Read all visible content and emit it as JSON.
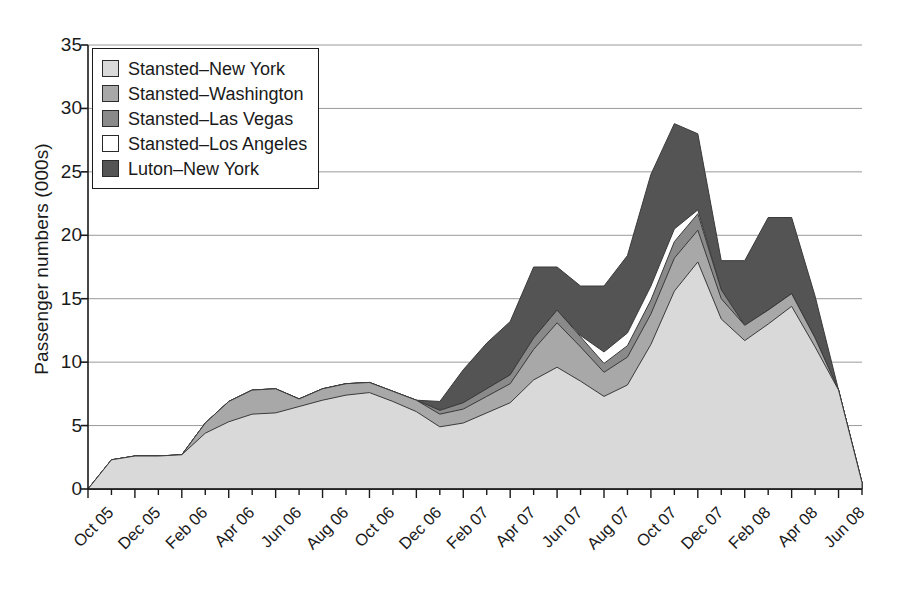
{
  "chart_data": {
    "type": "area",
    "stacked": true,
    "title": "",
    "xlabel": "",
    "ylabel": "Passenger numbers (000s)",
    "ylim": [
      0,
      35
    ],
    "yticks": [
      0,
      5,
      10,
      15,
      20,
      25,
      30,
      35
    ],
    "grid": "horizontal",
    "legend_position": "top-left",
    "x": [
      "Oct 05",
      "Nov 05",
      "Dec 05",
      "Jan 06",
      "Feb 06",
      "Mar 06",
      "Apr 06",
      "May 06",
      "Jun 06",
      "Jul 06",
      "Aug 06",
      "Sep 06",
      "Oct 06",
      "Nov 06",
      "Dec 06",
      "Jan 07",
      "Feb 07",
      "Mar 07",
      "Apr 07",
      "May 07",
      "Jun 07",
      "Jul 07",
      "Aug 07",
      "Sep 07",
      "Oct 07",
      "Nov 07",
      "Dec 07",
      "Jan 08",
      "Feb 08",
      "Mar 08",
      "Apr 08",
      "May 08",
      "Jun 08",
      "Jul 08"
    ],
    "tick_labels": [
      "Oct 05",
      "Dec 05",
      "Feb 06",
      "Apr 06",
      "Jun 06",
      "Aug 06",
      "Oct 06",
      "Dec 06",
      "Feb 07",
      "Apr 07",
      "Jun 07",
      "Aug 07",
      "Oct 07",
      "Dec 07",
      "Feb 08",
      "Apr 08",
      "Jun 08"
    ],
    "tick_label_indices": [
      0,
      2,
      4,
      6,
      8,
      10,
      12,
      14,
      16,
      18,
      20,
      22,
      24,
      26,
      28,
      30,
      32
    ],
    "series": [
      {
        "name": "Stansted–New York",
        "color": "#d9d9d9",
        "values": [
          0,
          2.3,
          2.6,
          2.6,
          2.7,
          4.4,
          5.3,
          5.9,
          6.0,
          6.5,
          7.0,
          7.4,
          7.6,
          6.9,
          6.1,
          4.9,
          5.2,
          6.0,
          6.8,
          8.6,
          9.6,
          8.5,
          7.3,
          8.2,
          11.4,
          15.6,
          17.9,
          13.4,
          11.7,
          13.0,
          14.4,
          11.2,
          7.8,
          0.5
        ]
      },
      {
        "name": "Stansted–Washington",
        "color": "#a8a8a8",
        "values": [
          0,
          0,
          0,
          0,
          0,
          0.8,
          1.6,
          1.9,
          1.9,
          0.6,
          0.9,
          0.9,
          0.8,
          0.8,
          0.9,
          1.0,
          1.1,
          1.3,
          1.5,
          2.4,
          3.5,
          2.7,
          1.9,
          2.2,
          2.4,
          2.6,
          2.5,
          1.6,
          1.2,
          1.1,
          1.0,
          0.7,
          0,
          0
        ]
      },
      {
        "name": "Stansted–Las Vegas",
        "color": "#8a8a8a",
        "values": [
          0,
          0,
          0,
          0,
          0,
          0,
          0,
          0,
          0,
          0,
          0,
          0,
          0,
          0,
          0,
          0.3,
          0.5,
          0.6,
          0.7,
          0.9,
          1.0,
          0.8,
          0.7,
          0.9,
          1.1,
          1.3,
          1.3,
          0.7,
          0,
          0,
          0,
          0,
          0,
          0
        ]
      },
      {
        "name": "Stansted–Los Angeles",
        "color": "#ffffff",
        "values": [
          0,
          0,
          0,
          0,
          0,
          0,
          0,
          0,
          0,
          0,
          0,
          0,
          0,
          0,
          0,
          0,
          0,
          0,
          0,
          0,
          0,
          0.1,
          0.9,
          1.0,
          1.1,
          1.0,
          0.3,
          0,
          0,
          0,
          0,
          0,
          0,
          0
        ]
      },
      {
        "name": "Luton–New York",
        "color": "#545454",
        "values": [
          0,
          0,
          0,
          0,
          0,
          0,
          0,
          0,
          0,
          0,
          0,
          0,
          0,
          0,
          0,
          0.7,
          2.6,
          3.6,
          4.2,
          5.6,
          3.4,
          3.9,
          5.2,
          6.1,
          8.8,
          8.3,
          6.0,
          2.3,
          5.1,
          7.3,
          6.0,
          3.3,
          0,
          0
        ]
      }
    ]
  },
  "legend": {
    "items": [
      {
        "label": "Stansted–New York",
        "color": "#d9d9d9"
      },
      {
        "label": "Stansted–Washington",
        "color": "#a8a8a8"
      },
      {
        "label": "Stansted–Las Vegas",
        "color": "#8a8a8a"
      },
      {
        "label": "Stansted–Los Angeles",
        "color": "#ffffff"
      },
      {
        "label": "Luton–New York",
        "color": "#545454"
      }
    ]
  },
  "axes": {
    "y_title": "Passenger numbers (000s)",
    "axis_color": "#1a1a1a",
    "grid_color": "#9a9a9a"
  }
}
